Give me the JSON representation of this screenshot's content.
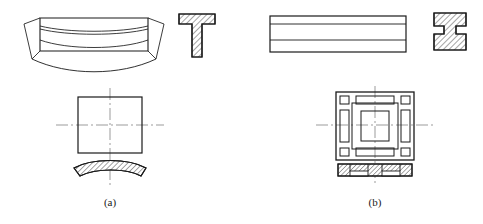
{
  "figure": {
    "title": "",
    "background_color": "#ffffff",
    "line_color": "#1a1a1a",
    "centerline_color": "#8a8a8a",
    "hatch_color": "#1a1a1a",
    "width": 483,
    "height": 224
  },
  "captions": {
    "left": "(a)",
    "right": "(b)"
  },
  "subfigure_a": {
    "caption": "(a)",
    "views": [
      {
        "name": "front-view-curved-bar",
        "description": "curved bar front view with tapered ends and arc profile lines"
      },
      {
        "name": "section-view-t-profile",
        "description": "T-shaped hatched cross section"
      },
      {
        "name": "top-view-square",
        "description": "square top view with horizontal and vertical centerlines"
      },
      {
        "name": "section-view-curved-strip",
        "description": "curved hatched section strip"
      }
    ]
  },
  "subfigure_b": {
    "caption": "(b)",
    "views": [
      {
        "name": "front-view-rectangular-bar",
        "description": "rectangular bar front view with two internal horizontal lines"
      },
      {
        "name": "section-view-i-profile",
        "description": "I-shaped (H) hatched cross section"
      },
      {
        "name": "top-view-framed-square",
        "description": "square top view with nested frame, corner blocks and centerlines"
      },
      {
        "name": "section-view-flat-strip",
        "description": "flat hatched section strip with bottom notches"
      }
    ]
  }
}
